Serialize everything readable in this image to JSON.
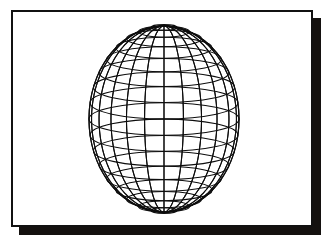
{
  "figure": {
    "kind": "wireframe-globe-illustration",
    "caption": "",
    "page_background": "#ffffff"
  },
  "plate": {
    "name": "framed-illustration-plate",
    "background": "#ffffff",
    "border_color": "#111111",
    "border_width_px": 2,
    "x": 11,
    "y": 10,
    "width": 302,
    "height": 217
  },
  "shadow": {
    "name": "plate-drop-shadow",
    "color": "#14110f",
    "offset_x_px": 8,
    "offset_y_px": 8
  },
  "globe": {
    "name": "wireframe-globe",
    "line_color": "#0d0d0d",
    "line_width_px": 1.05,
    "center_x": 151,
    "center_y": 107,
    "radius_x": 75,
    "radius_y": 93,
    "meridian_count": 24,
    "parallel_count": 17,
    "show_hidden_lines": true,
    "tilt_degrees": 0,
    "north_pole_y": 14,
    "south_pole_y": 200
  },
  "chart_data": {
    "type": "scatter",
    "xlabel": "",
    "ylabel": "",
    "projection": "orthographic",
    "meridian_longitudes_deg": [
      0,
      15,
      30,
      45,
      60,
      75,
      90,
      105,
      120,
      135,
      150,
      165,
      180,
      195,
      210,
      225,
      240,
      255,
      270,
      285,
      300,
      315,
      330,
      345
    ],
    "parallel_latitudes_deg": [
      -80,
      -70,
      -60,
      -50,
      -40,
      -30,
      -20,
      -10,
      0,
      10,
      20,
      30,
      40,
      50,
      60,
      70,
      80
    ],
    "legend": [],
    "grid": true
  }
}
